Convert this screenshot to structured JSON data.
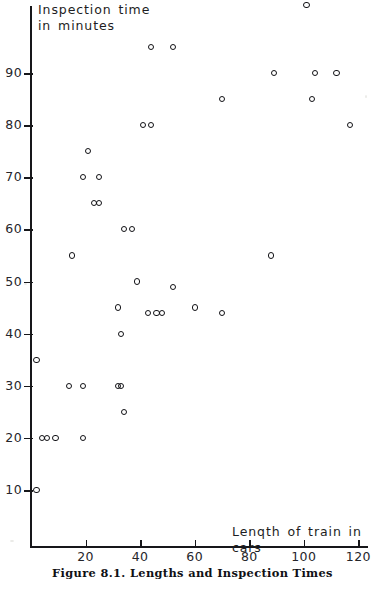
{
  "figure": {
    "caption": "Figure 8.1.  Lengths and Inspection Times"
  },
  "chart_data": {
    "type": "scatter",
    "title": "Figure 8.1. Lengths and Inspection Times",
    "xlabel": "Lenqth of train in cars",
    "ylabel": "Inspection time\nin minutes",
    "xlim": [
      0,
      124
    ],
    "ylim": [
      0,
      104
    ],
    "xticks": [
      20,
      40,
      60,
      80,
      100,
      120
    ],
    "yticks": [
      10,
      20,
      30,
      40,
      50,
      60,
      70,
      80,
      90
    ],
    "grid": false,
    "legend": null,
    "marker": "open-circle",
    "series": [
      {
        "name": "trains",
        "points": [
          [
            2,
            35
          ],
          [
            2,
            10
          ],
          [
            4,
            20
          ],
          [
            6,
            20
          ],
          [
            9,
            20
          ],
          [
            14,
            30
          ],
          [
            15,
            55
          ],
          [
            19,
            30
          ],
          [
            19,
            20
          ],
          [
            19,
            70
          ],
          [
            21,
            75
          ],
          [
            23,
            65
          ],
          [
            25,
            65
          ],
          [
            25,
            70
          ],
          [
            33,
            40
          ],
          [
            32,
            45
          ],
          [
            32,
            30
          ],
          [
            33,
            30
          ],
          [
            34,
            25
          ],
          [
            34,
            60
          ],
          [
            37,
            60
          ],
          [
            39,
            50
          ],
          [
            43,
            44
          ],
          [
            46,
            44
          ],
          [
            48,
            44
          ],
          [
            41,
            80
          ],
          [
            44,
            80
          ],
          [
            44,
            95
          ],
          [
            52,
            95
          ],
          [
            52,
            49
          ],
          [
            60,
            45
          ],
          [
            70,
            44
          ],
          [
            70,
            85
          ],
          [
            88,
            55
          ],
          [
            89,
            90
          ],
          [
            101,
            103
          ],
          [
            103,
            85
          ],
          [
            104,
            90
          ],
          [
            112,
            90
          ],
          [
            117,
            80
          ]
        ]
      }
    ]
  },
  "axes": {
    "y_tick_labels": [
      "90",
      "80",
      "70",
      "60",
      "50",
      "40",
      "30",
      "20",
      "10"
    ],
    "x_tick_labels": [
      "20",
      "40",
      "60",
      "80",
      "100",
      "120"
    ],
    "y_caption": "Inspection time\nin minutes",
    "x_caption": "Lenqth of train in cars"
  }
}
